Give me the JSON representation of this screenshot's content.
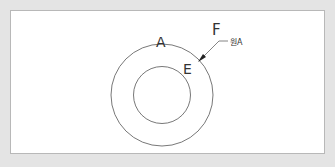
{
  "diagram": {
    "labels": {
      "outer_circle": "A",
      "inner_point": "E",
      "pointer_label": "F",
      "callout_text": "원A"
    },
    "colors": {
      "background": "#e4e4e4",
      "frame": "#ffffff",
      "stroke": "#555555",
      "text": "#333333"
    }
  }
}
